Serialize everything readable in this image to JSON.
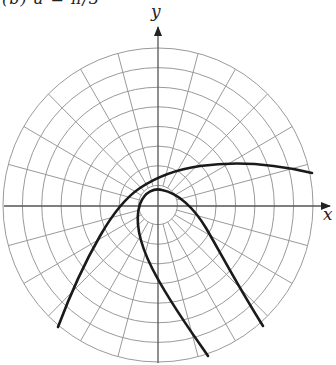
{
  "figure": {
    "caption": "(b) a = π/3",
    "axes": {
      "x_label": "x",
      "y_label": "y"
    },
    "grid": {
      "type": "polar",
      "ring_count": 8,
      "radial_step_degrees": 15,
      "grid_color": "#9a9a9a",
      "axis_color": "#555555"
    },
    "curves": [
      {
        "name": "outer-curve",
        "description": "Curve rising from lower left, passing above origin, flattening toward the right",
        "color": "#1a1a1a"
      },
      {
        "name": "inner-curve",
        "description": "Parabola-like curve opening downward, vertex just above origin",
        "color": "#1a1a1a"
      }
    ]
  }
}
